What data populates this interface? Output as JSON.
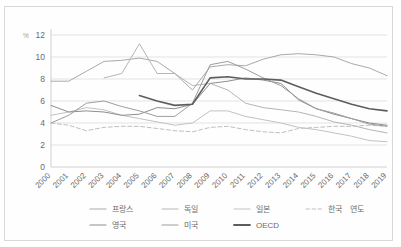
{
  "chart_data": {
    "type": "line",
    "title": "",
    "subtitle": "",
    "xlabel": "연도",
    "ylabel": "%",
    "ylim": [
      0,
      12
    ],
    "yticks": [
      0,
      2,
      4,
      6,
      8,
      10,
      12
    ],
    "grid": true,
    "legend_position": "bottom",
    "x": [
      2000,
      2001,
      2002,
      2003,
      2004,
      2005,
      2006,
      2007,
      2008,
      2009,
      2010,
      2011,
      2012,
      2013,
      2014,
      2015,
      2016,
      2017,
      2018,
      2019
    ],
    "xticklabels": [
      "2000",
      "2001",
      "2002",
      "2003",
      "2004",
      "2005",
      "2006",
      "2007",
      "2008",
      "2009",
      "2010",
      "2011",
      "2012",
      "2013",
      "2014",
      "2015",
      "2016",
      "2017",
      "2018",
      "2019"
    ],
    "series": [
      {
        "name": "프랑스",
        "color": "#a9a9a9",
        "style": "solid",
        "values": [
          7.8,
          7.8,
          8.7,
          9.6,
          9.7,
          9.9,
          9.6,
          8.5,
          7.0,
          9.1,
          9.3,
          9.2,
          9.8,
          10.2,
          10.3,
          10.2,
          10.0,
          9.4,
          9.0,
          8.3
        ]
      },
      {
        "name": "독일",
        "color": "#b5b5b5",
        "style": "solid",
        "values": [
          null,
          null,
          null,
          8.1,
          8.5,
          11.2,
          8.5,
          8.5,
          7.4,
          7.6,
          7.0,
          5.8,
          5.4,
          5.2,
          5.0,
          4.6,
          4.1,
          3.8,
          3.4,
          3.1
        ]
      },
      {
        "name": "일본",
        "color": "#c2c2c2",
        "style": "solid",
        "values": [
          4.7,
          5.0,
          5.4,
          5.2,
          4.7,
          4.4,
          4.1,
          3.8,
          4.0,
          5.1,
          5.1,
          4.6,
          4.3,
          4.0,
          3.6,
          3.4,
          3.1,
          2.8,
          2.4,
          2.3
        ]
      },
      {
        "name": "한국",
        "color": "#bfbfbf",
        "style": "dashed",
        "values": [
          4.0,
          3.8,
          3.3,
          3.6,
          3.7,
          3.7,
          3.5,
          3.3,
          3.2,
          3.6,
          3.7,
          3.4,
          3.2,
          3.1,
          3.5,
          3.6,
          3.7,
          3.7,
          3.8,
          3.7
        ]
      },
      {
        "name": "영국",
        "color": "#8e8e8e",
        "style": "solid",
        "values": [
          5.6,
          5.0,
          5.1,
          5.0,
          4.7,
          4.8,
          5.4,
          5.3,
          5.7,
          7.6,
          7.8,
          8.1,
          7.9,
          7.6,
          6.1,
          5.3,
          4.8,
          4.4,
          4.0,
          3.8
        ]
      },
      {
        "name": "미국",
        "color": "#9d9d9d",
        "style": "solid",
        "values": [
          4.0,
          4.7,
          5.8,
          6.0,
          5.5,
          5.1,
          4.6,
          4.6,
          5.8,
          9.3,
          9.6,
          8.9,
          8.1,
          7.4,
          6.2,
          5.3,
          4.9,
          4.4,
          3.9,
          3.7
        ]
      },
      {
        "name": "OECD",
        "color": "#5d5d5d",
        "style": "solid",
        "values": [
          null,
          null,
          null,
          null,
          null,
          6.5,
          6.0,
          5.6,
          5.7,
          8.1,
          8.2,
          8.0,
          8.0,
          7.9,
          7.3,
          6.7,
          6.2,
          5.7,
          5.3,
          5.1
        ]
      }
    ],
    "legend": [
      {
        "label": "프랑스",
        "color": "#a9a9a9",
        "style": "solid"
      },
      {
        "label": "독일",
        "color": "#b5b5b5",
        "style": "solid"
      },
      {
        "label": "일본",
        "color": "#c2c2c2",
        "style": "solid"
      },
      {
        "label": "한국",
        "color": "#bfbfbf",
        "style": "dashed"
      },
      {
        "label": "영국",
        "color": "#8e8e8e",
        "style": "solid"
      },
      {
        "label": "미국",
        "color": "#9d9d9d",
        "style": "solid"
      },
      {
        "label": "OECD",
        "color": "#5d5d5d",
        "style": "solid"
      }
    ],
    "axis_unit_note": "연도"
  }
}
